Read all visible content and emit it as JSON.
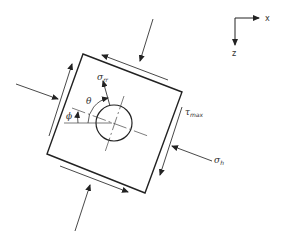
{
  "diagram": {
    "type": "wellbore stress element",
    "axes": {
      "x_label": "x",
      "z_label": "z"
    },
    "labels": {
      "sigma_rr": {
        "symbol": "σ",
        "subscript": "rr"
      },
      "theta": "θ",
      "phi": "ϕ",
      "tau_max": {
        "symbol": "τ",
        "subscript": "max"
      },
      "sigma_h": {
        "symbol": "σ",
        "subscript": "h"
      }
    }
  }
}
